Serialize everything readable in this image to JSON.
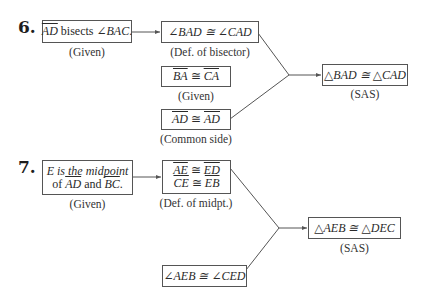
{
  "problems": [
    {
      "number": "6.",
      "start": {
        "parts": [
          {
            "text": "AD",
            "overline": true
          },
          {
            "text": " bisects ∠"
          },
          {
            "text": "BAC",
            "italic": true
          },
          {
            "text": "."
          }
        ],
        "reason": "(Given)"
      },
      "steps": [
        {
          "statement": "∠BAD ≅ ∠CAD",
          "reason": "(Def. of bisector)"
        },
        {
          "statement_left": "BA",
          "statement_op": " ≅ ",
          "statement_right": "CA",
          "reason": "(Given)"
        },
        {
          "statement_left": "AD",
          "statement_op": " ≅ ",
          "statement_right": "AD",
          "reason": "(Common side)"
        }
      ],
      "conclusion": {
        "statement": "△BAD ≅ △CAD",
        "reason": "(SAS)"
      }
    },
    {
      "number": "7.",
      "start": {
        "line1": "E is the midpoint",
        "line2_pre": "of ",
        "line2_seg1": "AD",
        "line2_mid": " and ",
        "line2_seg2": "BC",
        "line2_post": ".",
        "reason": "(Given)"
      },
      "steps": [
        {
          "line1_left": "AE",
          "line1_right": "ED",
          "line2_left": "CE",
          "line2_right": "EB",
          "op": " ≅ ",
          "reason": "(Def. of midpt.)"
        },
        {
          "statement": "∠AEB ≅ ∠CED",
          "reason": ""
        }
      ],
      "conclusion": {
        "statement": "△AEB ≅ △DEC",
        "reason": "(SAS)"
      }
    }
  ],
  "colors": {
    "line": "#555555",
    "text": "#2a2a2a"
  }
}
